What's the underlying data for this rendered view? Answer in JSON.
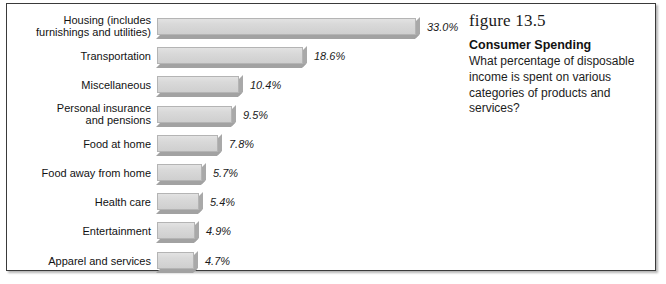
{
  "figure": {
    "number_label": "figure 13.5",
    "title": "Consumer Spending",
    "description": "What percentage of disposable income is spent on various categories of products and services?"
  },
  "chart_data": {
    "type": "bar",
    "orientation": "horizontal",
    "title": "Consumer Spending",
    "xlabel": "",
    "ylabel": "",
    "xlim": [
      0,
      33
    ],
    "grid": false,
    "legend": null,
    "value_suffix": "%",
    "categories": [
      "Housing (includes\nfurnishings and utilities)",
      "Transportation",
      "Miscellaneous",
      "Personal insurance\nand pensions",
      "Food at home",
      "Food away from home",
      "Health care",
      "Entertainment",
      "Apparel and services"
    ],
    "values": [
      33.0,
      18.6,
      10.4,
      9.5,
      7.8,
      5.7,
      5.4,
      4.9,
      4.7
    ],
    "value_labels": [
      "33.0%",
      "18.6%",
      "10.4%",
      "9.5%",
      "7.8%",
      "5.7%",
      "5.4%",
      "4.9%",
      "4.7%"
    ],
    "colors": {
      "bar_face": "#d9d9d9",
      "bar_shadow": "#a6a6a6",
      "bar_border": "#b4b4b4",
      "text": "#121212",
      "frame": "#3a3a3a"
    }
  }
}
